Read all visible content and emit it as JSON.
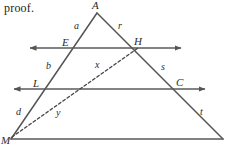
{
  "page": {
    "width": 231,
    "height": 151,
    "background": "#ffffff",
    "caption": "proof."
  },
  "figure": {
    "name": "triangle-with-two-parallel-transversal-lines",
    "stroke_color": "#555555",
    "dashed_color": "#4a4a4a",
    "stroke_width": 1.4,
    "vertices": {
      "A": {
        "x": 97,
        "y": 13
      },
      "M": {
        "x": 11,
        "y": 139
      },
      "B": {
        "x": 223,
        "y": 139
      }
    },
    "solid_lines": [
      {
        "name": "side-A-M",
        "x1": 97,
        "y1": 13,
        "x2": 11,
        "y2": 139
      },
      {
        "name": "side-A-B",
        "x1": 97,
        "y1": 13,
        "x2": 223,
        "y2": 139
      },
      {
        "name": "base-M-B",
        "x1": 11,
        "y1": 139,
        "x2": 223,
        "y2": 139
      }
    ],
    "arrow_lines": [
      {
        "name": "line-E-H",
        "x1": 30,
        "y1": 48,
        "x2": 181,
        "y2": 48,
        "left_arrow": true,
        "right_arrow": true
      },
      {
        "name": "line-L-C",
        "x1": 14,
        "y1": 89,
        "x2": 205,
        "y2": 89,
        "left_arrow": true,
        "right_arrow": true
      }
    ],
    "dashed_lines": [
      {
        "name": "segment-M-H",
        "x1": 12,
        "y1": 137,
        "x2": 138,
        "y2": 48
      }
    ],
    "point_labels": [
      {
        "id": "A",
        "text": "A",
        "x": 92,
        "y": 0,
        "size": "cap"
      },
      {
        "id": "E",
        "text": "E",
        "x": 62,
        "y": 37,
        "size": "cap"
      },
      {
        "id": "H",
        "text": "H",
        "x": 134,
        "y": 36,
        "size": "cap"
      },
      {
        "id": "L",
        "text": "L",
        "x": 33,
        "y": 78,
        "size": "cap"
      },
      {
        "id": "C",
        "text": "C",
        "x": 176,
        "y": 77,
        "size": "cap"
      },
      {
        "id": "M",
        "text": "M",
        "x": 1,
        "y": 135,
        "size": "cap"
      }
    ],
    "segment_labels": [
      {
        "id": "a",
        "text": "a",
        "x": 74,
        "y": 21,
        "size": "low"
      },
      {
        "id": "r",
        "text": "r",
        "x": 118,
        "y": 21,
        "size": "low"
      },
      {
        "id": "b",
        "text": "b",
        "x": 46,
        "y": 61,
        "size": "low"
      },
      {
        "id": "x",
        "text": "x",
        "x": 95,
        "y": 60,
        "size": "low"
      },
      {
        "id": "s",
        "text": "s",
        "x": 161,
        "y": 62,
        "size": "low"
      },
      {
        "id": "d",
        "text": "d",
        "x": 16,
        "y": 107,
        "size": "low"
      },
      {
        "id": "y",
        "text": "y",
        "x": 56,
        "y": 108,
        "size": "low"
      },
      {
        "id": "t",
        "text": "t",
        "x": 200,
        "y": 107,
        "size": "low"
      }
    ]
  }
}
